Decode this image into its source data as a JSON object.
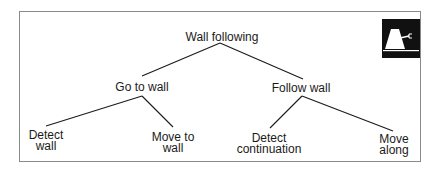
{
  "diagram": {
    "type": "tree",
    "root": {
      "label": "Wall following",
      "children": [
        {
          "label": "Go to wall",
          "children": [
            {
              "label_line1": "Detect",
              "label_line2": "wall"
            },
            {
              "label_line1": "Move to",
              "label_line2": "wall"
            }
          ]
        },
        {
          "label": "Follow wall",
          "children": [
            {
              "label_line1": "Detect",
              "label_line2": "continuation"
            },
            {
              "label_line1": "Move",
              "label_line2": "along"
            }
          ]
        }
      ]
    },
    "icon": "robot-icon",
    "colors": {
      "border": "#8a8a8a",
      "text": "#1a1a1a",
      "icon_bg": "#111111",
      "icon_fg": "#ffffff"
    }
  }
}
